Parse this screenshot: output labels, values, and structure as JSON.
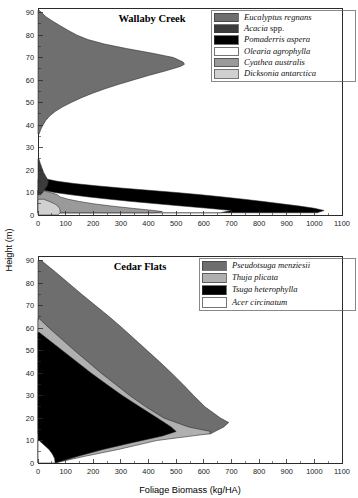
{
  "figure": {
    "axis": {
      "ylabel": "Height (m)",
      "xlabel": "Foliage Biomass (kg/HA)",
      "x_ticks": [
        0,
        100,
        200,
        300,
        400,
        500,
        600,
        700,
        800,
        900,
        1000,
        1100
      ],
      "y_ticks": [
        0,
        10,
        20,
        30,
        40,
        50,
        60,
        70,
        80,
        90
      ],
      "xlim": [
        0,
        1100
      ],
      "ylim": [
        0,
        92
      ]
    },
    "colors": {
      "dark_gray": "#6f6f6f",
      "darker_gray": "#3b3b3b",
      "black": "#000000",
      "white": "#ffffff",
      "mid_gray": "#9a9a9a",
      "light_gray": "#d0d0d0",
      "cedar_dark": "#6e6e6e",
      "cedar_mid": "#b0b0b0",
      "frame": "#2b2b2b"
    }
  },
  "chart_data": [
    {
      "type": "area",
      "id": "wallaby-creek",
      "title": "Wallaby Creek",
      "xlabel": "Foliage Biomass (kg/HA)",
      "ylabel": "Height (m)",
      "xlim": [
        0,
        1100
      ],
      "ylim": [
        0,
        92
      ],
      "grid": false,
      "legend_position": "top-right",
      "orientation": "horizontal-profile",
      "note": "Foliage biomass profile by canopy height; each species drawn as a silhouette extending right from the x=0 axis.",
      "series": [
        {
          "name": "Eucalyptus regnans",
          "color": "#6f6f6f",
          "peak_height_m": 67,
          "peak_biomass": 530,
          "height_range_m": [
            36,
            91
          ],
          "profile": [
            {
              "height": 91,
              "biomass": 4
            },
            {
              "height": 88,
              "biomass": 30
            },
            {
              "height": 86,
              "biomass": 55
            },
            {
              "height": 84,
              "biomass": 82
            },
            {
              "height": 82,
              "biomass": 110
            },
            {
              "height": 80,
              "biomass": 140
            },
            {
              "height": 78,
              "biomass": 180
            },
            {
              "height": 76,
              "biomass": 240
            },
            {
              "height": 74,
              "biomass": 320
            },
            {
              "height": 72,
              "biomass": 410
            },
            {
              "height": 70,
              "biomass": 490
            },
            {
              "height": 68,
              "biomass": 525
            },
            {
              "height": 67,
              "biomass": 530
            },
            {
              "height": 66,
              "biomass": 515
            },
            {
              "height": 64,
              "biomass": 460
            },
            {
              "height": 62,
              "biomass": 400
            },
            {
              "height": 60,
              "biomass": 345
            },
            {
              "height": 58,
              "biomass": 290
            },
            {
              "height": 56,
              "biomass": 240
            },
            {
              "height": 54,
              "biomass": 195
            },
            {
              "height": 52,
              "biomass": 155
            },
            {
              "height": 50,
              "biomass": 120
            },
            {
              "height": 48,
              "biomass": 88
            },
            {
              "height": 46,
              "biomass": 62
            },
            {
              "height": 44,
              "biomass": 42
            },
            {
              "height": 42,
              "biomass": 28
            },
            {
              "height": 40,
              "biomass": 18
            },
            {
              "height": 38,
              "biomass": 10
            },
            {
              "height": 36,
              "biomass": 4
            }
          ]
        },
        {
          "name": "Acacia spp.",
          "color": "#3b3b3b",
          "peak_height_m": 15,
          "peak_biomass": 38,
          "height_range_m": [
            9,
            25
          ],
          "profile": [
            {
              "height": 25,
              "biomass": 3
            },
            {
              "height": 23,
              "biomass": 8
            },
            {
              "height": 21,
              "biomass": 14
            },
            {
              "height": 19,
              "biomass": 20
            },
            {
              "height": 17,
              "biomass": 29
            },
            {
              "height": 15,
              "biomass": 38
            },
            {
              "height": 13,
              "biomass": 34
            },
            {
              "height": 11,
              "biomass": 22
            },
            {
              "height": 9,
              "biomass": 10
            }
          ]
        },
        {
          "name": "Pomaderris aspera",
          "color": "#000000",
          "peak_height_m": 2,
          "peak_biomass": 1035,
          "height_range_m": [
            1,
            16
          ],
          "profile": [
            {
              "height": 16,
              "biomass": 30
            },
            {
              "height": 15,
              "biomass": 70
            },
            {
              "height": 14,
              "biomass": 130
            },
            {
              "height": 13,
              "biomass": 210
            },
            {
              "height": 12,
              "biomass": 300
            },
            {
              "height": 11,
              "biomass": 400
            },
            {
              "height": 10,
              "biomass": 500
            },
            {
              "height": 9,
              "biomass": 590
            },
            {
              "height": 8,
              "biomass": 670
            },
            {
              "height": 7,
              "biomass": 745
            },
            {
              "height": 6,
              "biomass": 815
            },
            {
              "height": 5,
              "biomass": 880
            },
            {
              "height": 4,
              "biomass": 945
            },
            {
              "height": 3,
              "biomass": 1000
            },
            {
              "height": 2,
              "biomass": 1035
            },
            {
              "height": 1,
              "biomass": 1010
            }
          ]
        },
        {
          "name": "Olearia agrophylla",
          "color": "#ffffff",
          "peak_height_m": 2,
          "peak_biomass": 700,
          "height_range_m": [
            0.5,
            11
          ],
          "profile": [
            {
              "height": 11,
              "biomass": 20
            },
            {
              "height": 10,
              "biomass": 60
            },
            {
              "height": 9,
              "biomass": 120
            },
            {
              "height": 8,
              "biomass": 185
            },
            {
              "height": 7,
              "biomass": 260
            },
            {
              "height": 6,
              "biomass": 340
            },
            {
              "height": 5,
              "biomass": 430
            },
            {
              "height": 4,
              "biomass": 520
            },
            {
              "height": 3,
              "biomass": 615
            },
            {
              "height": 2,
              "biomass": 700
            },
            {
              "height": 1,
              "biomass": 660
            }
          ]
        },
        {
          "name": "Cyathea australis",
          "color": "#9a9a9a",
          "peak_height_m": 1.5,
          "peak_biomass": 450,
          "height_range_m": [
            0.5,
            11
          ],
          "profile": [
            {
              "height": 11,
              "biomass": 12
            },
            {
              "height": 10,
              "biomass": 45
            },
            {
              "height": 9,
              "biomass": 70
            },
            {
              "height": 8,
              "biomass": 80
            },
            {
              "height": 7,
              "biomass": 110
            },
            {
              "height": 6,
              "biomass": 150
            },
            {
              "height": 5,
              "biomass": 200
            },
            {
              "height": 4,
              "biomass": 265
            },
            {
              "height": 3,
              "biomass": 340
            },
            {
              "height": 2,
              "biomass": 420
            },
            {
              "height": 1.5,
              "biomass": 450
            },
            {
              "height": 1,
              "biomass": 420
            }
          ]
        },
        {
          "name": "Dicksonia antarctica",
          "color": "#d0d0d0",
          "peak_height_m": 1,
          "peak_biomass": 80,
          "height_range_m": [
            0,
            7
          ],
          "profile": [
            {
              "height": 7,
              "biomass": 20
            },
            {
              "height": 6,
              "biomass": 42
            },
            {
              "height": 5,
              "biomass": 60
            },
            {
              "height": 4,
              "biomass": 72
            },
            {
              "height": 3,
              "biomass": 78
            },
            {
              "height": 2,
              "biomass": 80
            },
            {
              "height": 1,
              "biomass": 80
            },
            {
              "height": 0,
              "biomass": 72
            }
          ]
        }
      ],
      "legend": [
        {
          "label": "Eucalyptus regnans",
          "color": "#6f6f6f",
          "italic": true
        },
        {
          "label": "Acacia spp.",
          "color": "#3b3b3b",
          "italic": true,
          "roman_suffix": " spp.",
          "italic_part": "Acacia"
        },
        {
          "label": "Pomaderris aspera",
          "color": "#000000",
          "italic": true
        },
        {
          "label": "Olearia agrophylla",
          "color": "#ffffff",
          "italic": true
        },
        {
          "label": "Cyathea australis",
          "color": "#9a9a9a",
          "italic": true
        },
        {
          "label": "Dicksonia antarctica",
          "color": "#d0d0d0",
          "italic": true
        }
      ]
    },
    {
      "type": "area",
      "id": "cedar-flats",
      "title": "Cedar Flats",
      "xlabel": "Foliage Biomass (kg/HA)",
      "ylabel": "Height (m)",
      "xlim": [
        0,
        1100
      ],
      "ylim": [
        0,
        92
      ],
      "grid": false,
      "legend_position": "top-right",
      "orientation": "horizontal-profile",
      "note": "Cumulative stacked foliage biomass profile by canopy height.",
      "series": [
        {
          "name": "Pseudotsuga menziesii",
          "color": "#6e6e6e",
          "max_biomass": 690,
          "height_range_m": [
            13,
            90
          ],
          "outer_profile": [
            {
              "height": 90,
              "biomass": 12
            },
            {
              "height": 85,
              "biomass": 62
            },
            {
              "height": 80,
              "biomass": 110
            },
            {
              "height": 75,
              "biomass": 158
            },
            {
              "height": 70,
              "biomass": 208
            },
            {
              "height": 65,
              "biomass": 258
            },
            {
              "height": 60,
              "biomass": 305
            },
            {
              "height": 55,
              "biomass": 350
            },
            {
              "height": 50,
              "biomass": 395
            },
            {
              "height": 45,
              "biomass": 440
            },
            {
              "height": 40,
              "biomass": 483
            },
            {
              "height": 35,
              "biomass": 524
            },
            {
              "height": 30,
              "biomass": 563
            },
            {
              "height": 25,
              "biomass": 604
            },
            {
              "height": 20,
              "biomass": 660
            },
            {
              "height": 18,
              "biomass": 690
            },
            {
              "height": 16,
              "biomass": 672
            },
            {
              "height": 14,
              "biomass": 640
            },
            {
              "height": 13,
              "biomass": 625
            }
          ]
        },
        {
          "name": "Thuja plicata",
          "color": "#b0b0b0",
          "max_biomass": 640,
          "height_range_m": [
            0,
            64
          ],
          "outer_profile": [
            {
              "height": 64,
              "biomass": 6
            },
            {
              "height": 60,
              "biomass": 40
            },
            {
              "height": 55,
              "biomass": 86
            },
            {
              "height": 50,
              "biomass": 132
            },
            {
              "height": 45,
              "biomass": 180
            },
            {
              "height": 40,
              "biomass": 228
            },
            {
              "height": 35,
              "biomass": 280
            },
            {
              "height": 30,
              "biomass": 332
            },
            {
              "height": 25,
              "biomass": 390
            },
            {
              "height": 20,
              "biomass": 455
            },
            {
              "height": 16,
              "biomass": 545
            },
            {
              "height": 14,
              "biomass": 625
            },
            {
              "height": 13,
              "biomass": 620
            },
            {
              "height": 10,
              "biomass": 430
            },
            {
              "height": 6,
              "biomass": 290
            },
            {
              "height": 3,
              "biomass": 170
            },
            {
              "height": 0,
              "biomass": 60
            }
          ]
        },
        {
          "name": "Tsuga heterophylla",
          "color": "#000000",
          "max_biomass": 500,
          "height_range_m": [
            0,
            58
          ],
          "outer_profile": [
            {
              "height": 58,
              "biomass": 5
            },
            {
              "height": 55,
              "biomass": 36
            },
            {
              "height": 50,
              "biomass": 88
            },
            {
              "height": 45,
              "biomass": 140
            },
            {
              "height": 40,
              "biomass": 192
            },
            {
              "height": 35,
              "biomass": 248
            },
            {
              "height": 30,
              "biomass": 305
            },
            {
              "height": 25,
              "biomass": 368
            },
            {
              "height": 20,
              "biomass": 432
            },
            {
              "height": 16,
              "biomass": 482
            },
            {
              "height": 14,
              "biomass": 500
            },
            {
              "height": 12,
              "biomass": 450
            },
            {
              "height": 9,
              "biomass": 340
            },
            {
              "height": 6,
              "biomass": 235
            },
            {
              "height": 3,
              "biomass": 145
            },
            {
              "height": 0,
              "biomass": 62
            }
          ]
        },
        {
          "name": "Acer circinatum",
          "color": "#ffffff",
          "max_biomass": 62,
          "height_range_m": [
            0,
            10
          ],
          "outer_profile": [
            {
              "height": 10,
              "biomass": 4
            },
            {
              "height": 8,
              "biomass": 22
            },
            {
              "height": 6,
              "biomass": 40
            },
            {
              "height": 4,
              "biomass": 52
            },
            {
              "height": 2,
              "biomass": 60
            },
            {
              "height": 0,
              "biomass": 62
            }
          ]
        }
      ],
      "legend": [
        {
          "label": "Pseudotsuga menziesii",
          "color": "#6e6e6e",
          "italic": true
        },
        {
          "label": "Thuja plicata",
          "color": "#b0b0b0",
          "italic": true
        },
        {
          "label": "Tsuga heterophylla",
          "color": "#000000",
          "italic": true
        },
        {
          "label": "Acer circinatum",
          "color": "#ffffff",
          "italic": true
        }
      ]
    }
  ]
}
